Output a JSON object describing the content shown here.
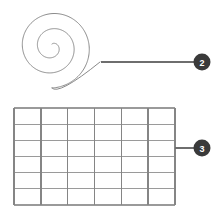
{
  "figure": {
    "background_color": "#ffffff",
    "stroke_color": "#8a8a8a",
    "badge_color": "#3a3a3a",
    "badge_text_color": "#ffffff",
    "leader_color": "#6e6e6e"
  },
  "callouts": [
    {
      "number": "2",
      "target": "spiral",
      "badge_cx": 202,
      "badge_cy": 62,
      "badge_r": 8.5,
      "leader_x1": 101,
      "leader_x2": 194,
      "leader_y": 62
    },
    {
      "number": "3",
      "target": "grid",
      "badge_cx": 202,
      "badge_cy": 148,
      "badge_r": 8.5,
      "leader_x1": 175,
      "leader_x2": 194,
      "leader_y": 148
    }
  ],
  "spiral": {
    "name": "spiral",
    "center_x": 52,
    "center_y": 47,
    "turns": 2.5,
    "start_radius": 3,
    "end_radius": 41,
    "stroke_width": 1,
    "tail_end_x": 100,
    "tail_end_y": 62
  },
  "grid": {
    "name": "grid",
    "x": 14,
    "y": 108,
    "width": 161,
    "height": 97,
    "columns": 6,
    "rows": 6,
    "vertical_stroke_width": 1.4,
    "horizontal_stroke_width": 1.1,
    "vertical_color": "#858585",
    "horizontal_color": "#9a9a9a"
  }
}
